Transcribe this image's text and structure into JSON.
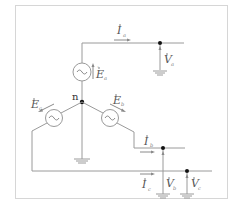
{
  "diagram": {
    "type": "three-phase-wye-source-circuit",
    "neutral_node": {
      "label": "n"
    },
    "sources": [
      {
        "id": "a",
        "label": "E",
        "subscript": "a"
      },
      {
        "id": "b",
        "label": "E",
        "subscript": "b"
      },
      {
        "id": "c",
        "label": "E",
        "subscript": "c"
      }
    ],
    "currents": [
      {
        "id": "a",
        "label": "I",
        "subscript": "a"
      },
      {
        "id": "b",
        "label": "I",
        "subscript": "b"
      },
      {
        "id": "c",
        "label": "I",
        "subscript": "c"
      }
    ],
    "voltages": [
      {
        "id": "a",
        "label": "V",
        "subscript": "a"
      },
      {
        "id": "b",
        "label": "V",
        "subscript": "b"
      },
      {
        "id": "c",
        "label": "V",
        "subscript": "c"
      }
    ],
    "colors": {
      "wire": "#9a9a9a",
      "node": "#111111",
      "frame": "#d6d6d6"
    }
  }
}
